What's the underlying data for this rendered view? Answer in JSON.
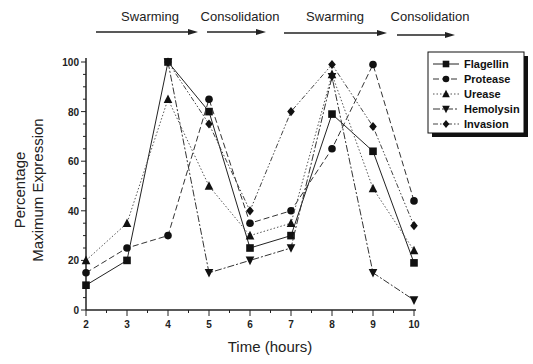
{
  "chart_data": {
    "type": "line",
    "title": "",
    "xlabel": "Time (hours)",
    "ylabel": [
      "Percentage",
      "Maximum Expression"
    ],
    "xlim": [
      2,
      10
    ],
    "ylim": [
      0,
      100
    ],
    "x_ticks": [
      2,
      3,
      4,
      5,
      6,
      7,
      8,
      9,
      10
    ],
    "y_ticks": [
      0,
      20,
      40,
      60,
      80,
      100
    ],
    "grid": false,
    "legend_position": "upper right",
    "phases": [
      {
        "label": "Swarming",
        "x_start": 2,
        "x_end": 4.8
      },
      {
        "label": "Consolidation",
        "x_start": 4.9,
        "x_end": 6.0
      },
      {
        "label": "Swarming",
        "x_start": 6.3,
        "x_end": 8.8
      },
      {
        "label": "Consolidation",
        "x_start": 8.9,
        "x_end": 10.0
      }
    ],
    "series": [
      {
        "name": "Flagellin",
        "marker": "square",
        "dash": "",
        "x": [
          2,
          3,
          4,
          5,
          6,
          7,
          8,
          9,
          10
        ],
        "values": [
          10,
          20,
          100,
          80,
          25,
          30,
          79,
          64,
          19
        ]
      },
      {
        "name": "Protease",
        "marker": "circle",
        "dash": "6,3",
        "x": [
          2,
          3,
          4,
          5,
          6,
          7,
          8,
          9,
          10
        ],
        "values": [
          15,
          25,
          30,
          85,
          35,
          40,
          65,
          99,
          44
        ]
      },
      {
        "name": "Urease",
        "marker": "triangle-up",
        "dash": "1.5,2",
        "x": [
          2,
          3,
          4,
          5,
          6,
          7,
          8,
          9,
          10
        ],
        "values": [
          20,
          35,
          85,
          50,
          30,
          35,
          95,
          49,
          24
        ]
      },
      {
        "name": "Hemolysin",
        "marker": "triangle-down",
        "dash": "7,2,2,2",
        "x": [
          4,
          5,
          6,
          7,
          8,
          9,
          10
        ],
        "values": [
          100,
          15,
          20,
          25,
          94,
          15,
          4
        ]
      },
      {
        "name": "Invasion",
        "marker": "diamond",
        "dash": "5,2,1.5,2,1.5,2",
        "x": [
          4,
          5,
          6,
          7,
          8,
          9,
          10
        ],
        "values": [
          100,
          75,
          40,
          80,
          99,
          74,
          34
        ]
      }
    ]
  }
}
